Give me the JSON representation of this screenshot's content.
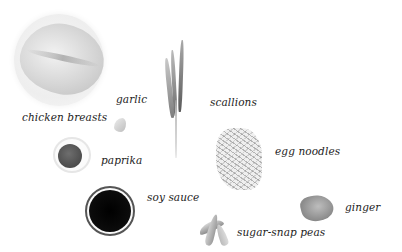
{
  "ingredients": [
    {
      "id": "chicken",
      "label": "chicken breasts"
    },
    {
      "id": "garlic",
      "label": "garlic"
    },
    {
      "id": "scallions",
      "label": "scallions"
    },
    {
      "id": "paprika",
      "label": "paprika"
    },
    {
      "id": "soy_sauce",
      "label": "soy sauce"
    },
    {
      "id": "egg_noodles",
      "label": "egg noodles"
    },
    {
      "id": "ginger",
      "label": "ginger"
    },
    {
      "id": "snap_peas",
      "label": "sugar-snap peas"
    }
  ],
  "colors": {
    "background": "#ffffff",
    "label_text": "#1c1c1c",
    "soy_sauce": "#000000",
    "paprika": "#4e4e4e"
  }
}
